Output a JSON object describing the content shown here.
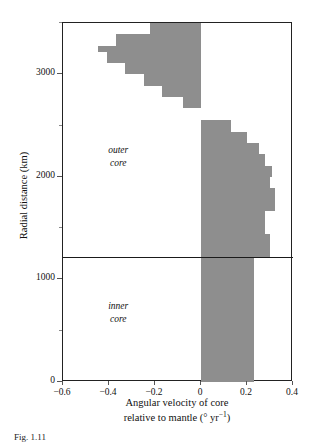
{
  "figure": {
    "caption_fragment": "Fig. 1.11",
    "y_axis_title": "Radial distance (km)",
    "x_axis_title_line1": "Angular velocity of core",
    "x_axis_title_line2_pre": "relative to mantle (",
    "x_axis_title_deg": "°",
    "x_axis_title_unit": " yr",
    "x_axis_title_exp": "−1",
    "x_axis_title_line2_post": ")",
    "annotations": [
      {
        "name": "outer-core",
        "line1": "outer",
        "line2": "core"
      },
      {
        "name": "inner-core",
        "line1": "inner",
        "line2": "core"
      }
    ]
  },
  "chart_data": {
    "type": "bar",
    "orientation": "horizontal",
    "title": "",
    "xlabel": "Angular velocity of core relative to mantle (° yr⁻¹)",
    "ylabel": "Radial distance (km)",
    "xlim": [
      -0.6,
      0.4
    ],
    "ylim": [
      0,
      3500
    ],
    "xticks": [
      -0.6,
      -0.4,
      -0.2,
      0,
      0.2,
      0.4
    ],
    "xtick_labels": [
      "−0.6",
      "−0.4",
      "−0.2",
      "0",
      "0.2",
      "0.4"
    ],
    "yticks": [
      0,
      1000,
      2000,
      3000
    ],
    "ytick_labels": [
      "0",
      "1000",
      "2000",
      "3000"
    ],
    "minor_yticks": [
      500,
      1500,
      2500,
      3500
    ],
    "grid": false,
    "legend": "none",
    "fill_color": "#8e8e8e",
    "axis_color": "#222222",
    "inner_core_boundary_km": 1220,
    "series": [
      {
        "name": "Angular velocity of core relative to mantle",
        "unit": "deg/yr",
        "y_unit": "km",
        "bins": [
          {
            "y_low": 0,
            "y_high": 1220,
            "value": 0.23
          },
          {
            "y_low": 1220,
            "y_high": 1440,
            "value": 0.3
          },
          {
            "y_low": 1440,
            "y_high": 1670,
            "value": 0.28
          },
          {
            "y_low": 1670,
            "y_high": 1890,
            "value": 0.32
          },
          {
            "y_low": 1890,
            "y_high": 2000,
            "value": 0.3
          },
          {
            "y_low": 2000,
            "y_high": 2110,
            "value": 0.31
          },
          {
            "y_low": 2110,
            "y_high": 2220,
            "value": 0.28
          },
          {
            "y_low": 2220,
            "y_high": 2330,
            "value": 0.25
          },
          {
            "y_low": 2330,
            "y_high": 2440,
            "value": 0.2
          },
          {
            "y_low": 2440,
            "y_high": 2550,
            "value": 0.13
          },
          {
            "y_low": 2550,
            "y_high": 2670,
            "value": 0.0
          },
          {
            "y_low": 2670,
            "y_high": 2780,
            "value": -0.08
          },
          {
            "y_low": 2780,
            "y_high": 2890,
            "value": -0.17
          },
          {
            "y_low": 2890,
            "y_high": 3000,
            "value": -0.25
          },
          {
            "y_low": 3000,
            "y_high": 3110,
            "value": -0.33
          },
          {
            "y_low": 3110,
            "y_high": 3220,
            "value": -0.41
          },
          {
            "y_low": 3220,
            "y_high": 3280,
            "value": -0.45
          },
          {
            "y_low": 3280,
            "y_high": 3390,
            "value": -0.37
          },
          {
            "y_low": 3390,
            "y_high": 3500,
            "value": -0.22
          }
        ]
      }
    ]
  }
}
